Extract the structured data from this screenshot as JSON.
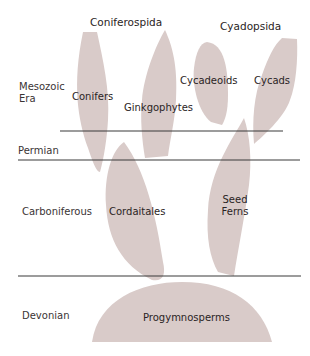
{
  "titles": {
    "coniferospida": "Coniferospida",
    "cyadopsida": "Cyadopsida"
  },
  "eras": {
    "mesozoic_line1": "Mesozoic",
    "mesozoic_line2": "Era",
    "permian": "Permian",
    "carboniferous": "Carboniferous",
    "devonian": "Devonian"
  },
  "groups": {
    "conifers": "Conifers",
    "ginkgophytes": "Ginkgophytes",
    "cycadeoids": "Cycadeoids",
    "cycads": "Cycads",
    "cordaitales": "Cordaitales",
    "seed_ferns_line1": "Seed",
    "seed_ferns_line2": "Ferns",
    "progymnosperms": "Progymnosperms"
  },
  "colors": {
    "shape_fill": "#d9cbc9",
    "line": "#3a3a3a"
  }
}
